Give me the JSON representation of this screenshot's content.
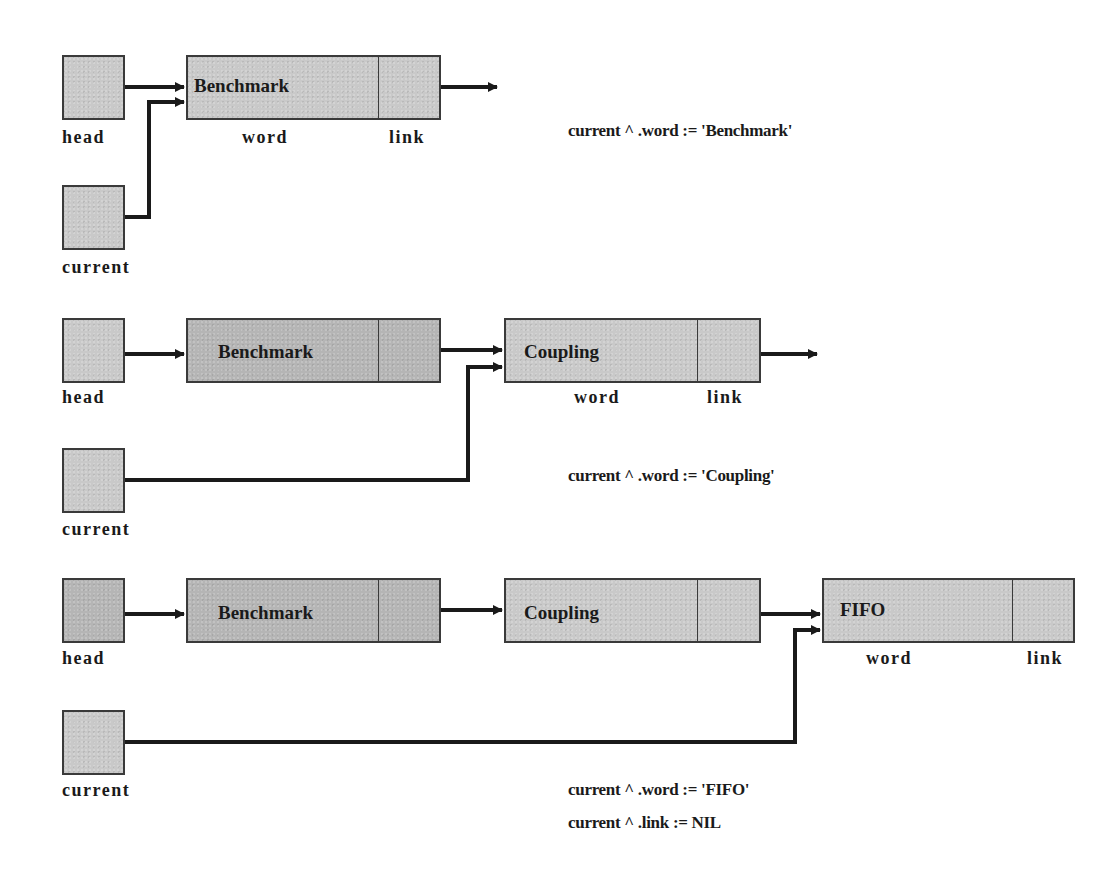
{
  "diagram": {
    "colors": {
      "node_fill": "#c9c9c9",
      "node_border": "#3a3a3a",
      "arrow": "#1a1a1a",
      "text": "#1a1a1a"
    },
    "field_labels": {
      "word": "word",
      "link": "link"
    },
    "pointer_labels": {
      "head": "head",
      "current": "current"
    },
    "steps": [
      {
        "nodes": [
          {
            "word": "Benchmark",
            "link": "next-arrow"
          }
        ],
        "statements": [
          "current^.word := 'Benchmark'"
        ],
        "statement_display": [
          "current ^ .word := 'Benchmark'"
        ]
      },
      {
        "nodes": [
          {
            "word": "Benchmark",
            "link": "arrow"
          },
          {
            "word": "Coupling",
            "link": "next-arrow"
          }
        ],
        "statements": [
          "current^.word := 'Coupling'"
        ],
        "statement_display": [
          "current ^ .word := 'Coupling'"
        ]
      },
      {
        "nodes": [
          {
            "word": "Benchmark",
            "link": "arrow"
          },
          {
            "word": "Coupling",
            "link": "arrow"
          },
          {
            "word": "FIFO",
            "link": "NIL"
          }
        ],
        "statements": [
          "current^.word := 'FIFO'",
          "current^.link := NIL"
        ],
        "statement_display": [
          "current ^ .word := 'FIFO'",
          "current ^ .link := NIL"
        ]
      }
    ]
  }
}
